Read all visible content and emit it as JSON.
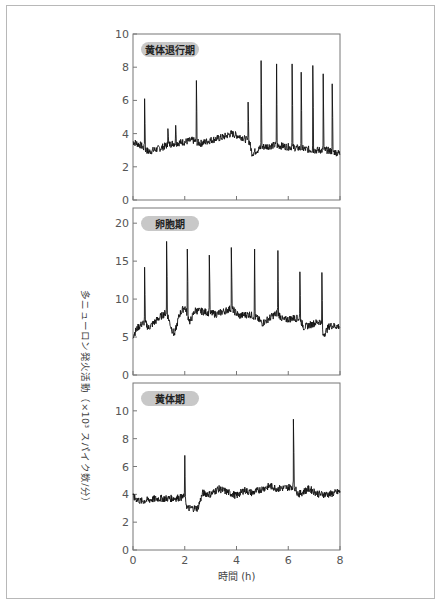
{
  "chart_data": [
    {
      "type": "line",
      "title": "黄体退行期",
      "xlabel": "",
      "ylabel": "多ニューロン発火活動（×10³ スパイク数/分）",
      "xlim": [
        0,
        8
      ],
      "ylim": [
        0,
        10
      ],
      "yticks": [
        0,
        2,
        4,
        6,
        8,
        10
      ],
      "xticks": [
        0,
        2,
        4,
        6,
        8
      ],
      "baseline": [
        [
          0,
          3.5
        ],
        [
          0.3,
          3.3
        ],
        [
          0.6,
          2.9
        ],
        [
          1,
          3.1
        ],
        [
          1.5,
          3.4
        ],
        [
          2,
          3.5
        ],
        [
          2.3,
          3.6
        ],
        [
          2.6,
          3.4
        ],
        [
          3,
          3.6
        ],
        [
          3.5,
          3.8
        ],
        [
          3.8,
          4.0
        ],
        [
          4.2,
          3.8
        ],
        [
          4.5,
          3.5
        ],
        [
          4.6,
          2.8
        ],
        [
          5,
          3.2
        ],
        [
          5.5,
          3.3
        ],
        [
          6,
          3.2
        ],
        [
          6.5,
          3.1
        ],
        [
          7,
          3.0
        ],
        [
          7.5,
          3.0
        ],
        [
          8,
          2.8
        ]
      ],
      "spikes": [
        [
          0.45,
          6.1
        ],
        [
          1.35,
          4.3
        ],
        [
          1.65,
          4.5
        ],
        [
          2.45,
          7.2
        ],
        [
          4.45,
          5.9
        ],
        [
          4.95,
          8.4
        ],
        [
          5.55,
          8.2
        ],
        [
          6.15,
          8.2
        ],
        [
          6.5,
          7.7
        ],
        [
          6.95,
          8.1
        ],
        [
          7.35,
          7.6
        ],
        [
          7.7,
          7.0
        ]
      ]
    },
    {
      "type": "line",
      "title": "卵胞期",
      "xlim": [
        0,
        8
      ],
      "ylim": [
        0,
        22
      ],
      "yticks": [
        0,
        5,
        10,
        15,
        20
      ],
      "xticks": [
        0,
        2,
        4,
        6,
        8
      ],
      "baseline": [
        [
          0,
          5.2
        ],
        [
          0.2,
          6.3
        ],
        [
          0.45,
          7.0
        ],
        [
          0.6,
          6.2
        ],
        [
          1,
          7.5
        ],
        [
          1.3,
          8.3
        ],
        [
          1.5,
          6.0
        ],
        [
          1.6,
          5.3
        ],
        [
          1.8,
          8.0
        ],
        [
          2,
          9.0
        ],
        [
          2.2,
          7.0
        ],
        [
          2.4,
          8.5
        ],
        [
          2.8,
          8.3
        ],
        [
          3.2,
          8.0
        ],
        [
          3.6,
          8.5
        ],
        [
          3.8,
          8.8
        ],
        [
          4.1,
          7.8
        ],
        [
          4.5,
          8.0
        ],
        [
          4.8,
          7.5
        ],
        [
          5.0,
          6.8
        ],
        [
          5.4,
          7.8
        ],
        [
          5.6,
          8.2
        ],
        [
          5.8,
          7.2
        ],
        [
          6.2,
          7.5
        ],
        [
          6.45,
          7.4
        ],
        [
          6.6,
          6.3
        ],
        [
          7,
          6.8
        ],
        [
          7.25,
          7.1
        ],
        [
          7.35,
          5.2
        ],
        [
          7.6,
          6.5
        ],
        [
          8,
          6.4
        ]
      ],
      "spikes": [
        [
          0.45,
          14.2
        ],
        [
          1.3,
          17.6
        ],
        [
          2.1,
          16.6
        ],
        [
          2.95,
          15.8
        ],
        [
          3.8,
          16.8
        ],
        [
          4.7,
          16.6
        ],
        [
          5.6,
          16.4
        ],
        [
          6.45,
          13.6
        ],
        [
          7.3,
          13.5
        ]
      ]
    },
    {
      "type": "line",
      "title": "黄体期",
      "xlabel": "時間 (h)",
      "xlim": [
        0,
        8
      ],
      "ylim": [
        0,
        12
      ],
      "yticks": [
        0,
        2,
        4,
        6,
        8,
        10
      ],
      "xticks": [
        0,
        2,
        4,
        6,
        8
      ],
      "baseline": [
        [
          0,
          3.8
        ],
        [
          0.3,
          3.5
        ],
        [
          0.6,
          3.6
        ],
        [
          1,
          3.7
        ],
        [
          1.5,
          3.7
        ],
        [
          2,
          3.8
        ],
        [
          2.1,
          3.0
        ],
        [
          2.5,
          3.0
        ],
        [
          2.7,
          4.1
        ],
        [
          3,
          4.0
        ],
        [
          3.3,
          4.4
        ],
        [
          3.6,
          4.2
        ],
        [
          4,
          3.9
        ],
        [
          4.3,
          4.3
        ],
        [
          4.6,
          4.1
        ],
        [
          5,
          4.4
        ],
        [
          5.3,
          4.6
        ],
        [
          5.6,
          4.4
        ],
        [
          6,
          4.5
        ],
        [
          6.2,
          4.6
        ],
        [
          6.4,
          4.0
        ],
        [
          6.8,
          4.4
        ],
        [
          7.2,
          4.0
        ],
        [
          7.6,
          4.0
        ],
        [
          8,
          4.2
        ]
      ],
      "spikes": [
        [
          2.0,
          6.8
        ],
        [
          6.2,
          9.4
        ]
      ]
    }
  ],
  "labels": {
    "panel1": "黄体退行期",
    "panel2": "卵胞期",
    "panel3": "黄体期",
    "yaxis": "多ニューロン発火活動（×10³ スパイク数/分）",
    "xaxis": "時間 (h)",
    "xticks": [
      "0",
      "2",
      "4",
      "6",
      "8"
    ]
  },
  "colors": {
    "trace": "#111111",
    "pill": "#c8c8c8",
    "axis": "#777777",
    "frame": "#b8b8b8"
  }
}
